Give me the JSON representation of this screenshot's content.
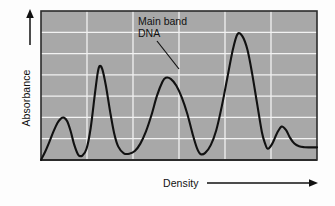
{
  "figure": {
    "background_color": "#fdfdfd",
    "plot_fill_color": "#a8a8a8",
    "grid_color": "#f2f2f2",
    "curve_color": "#111111",
    "frame_color": "#2b2b2b"
  },
  "axes": {
    "y_label": "Absorbance",
    "x_label": "Density",
    "y_arrow": "arrow-up-icon",
    "x_arrow": "arrow-right-icon"
  },
  "annotations": [
    {
      "name": "main-band-dna",
      "line1": "Main band",
      "line2": "DNA",
      "leader": "leader-line"
    }
  ],
  "chart_data": {
    "type": "line",
    "title": "",
    "xlabel": "Density",
    "ylabel": "Absorbance",
    "xlim": [
      0,
      1
    ],
    "ylim": [
      0,
      1
    ],
    "grid": true,
    "grid_x_count": 5,
    "grid_y_count": 6,
    "axis_ticks_labeled": false,
    "legend": "none",
    "annotation_points": [
      {
        "label": "Main band DNA",
        "x": 0.45,
        "y": 0.55
      }
    ],
    "features": [
      {
        "kind": "peak",
        "name": "satellite band 1",
        "x": 0.082,
        "y": 0.285
      },
      {
        "kind": "valley",
        "name": "valley 1",
        "x": 0.135,
        "y": 0.035
      },
      {
        "kind": "peak",
        "name": "satellite band 2",
        "x": 0.212,
        "y": 0.63
      },
      {
        "kind": "valley",
        "name": "valley 2",
        "x": 0.3,
        "y": 0.045
      },
      {
        "kind": "peak",
        "name": "main band DNA",
        "x": 0.452,
        "y": 0.552
      },
      {
        "kind": "valley",
        "name": "valley 3",
        "x": 0.578,
        "y": 0.04
      },
      {
        "kind": "peak",
        "name": "satellite band 3",
        "x": 0.712,
        "y": 0.845
      },
      {
        "kind": "valley",
        "name": "valley 4",
        "x": 0.822,
        "y": 0.075
      },
      {
        "kind": "peak",
        "name": "satellite band 4",
        "x": 0.872,
        "y": 0.225
      },
      {
        "kind": "plateau",
        "name": "baseline tail",
        "x": 0.97,
        "y": 0.085
      }
    ],
    "series": [
      {
        "name": "Absorbance profile",
        "x": [
          0.0,
          0.015,
          0.03,
          0.045,
          0.06,
          0.072,
          0.082,
          0.095,
          0.108,
          0.12,
          0.135,
          0.15,
          0.165,
          0.18,
          0.195,
          0.205,
          0.212,
          0.222,
          0.235,
          0.25,
          0.265,
          0.28,
          0.3,
          0.32,
          0.34,
          0.36,
          0.38,
          0.4,
          0.42,
          0.44,
          0.452,
          0.47,
          0.49,
          0.51,
          0.53,
          0.55,
          0.565,
          0.578,
          0.595,
          0.615,
          0.635,
          0.655,
          0.675,
          0.695,
          0.712,
          0.73,
          0.748,
          0.765,
          0.782,
          0.8,
          0.812,
          0.822,
          0.838,
          0.855,
          0.872,
          0.888,
          0.902,
          0.918,
          0.935,
          0.955,
          0.975,
          1.0
        ],
        "y": [
          0.0,
          0.055,
          0.12,
          0.19,
          0.25,
          0.278,
          0.285,
          0.26,
          0.19,
          0.105,
          0.035,
          0.03,
          0.075,
          0.215,
          0.44,
          0.58,
          0.63,
          0.61,
          0.5,
          0.33,
          0.18,
          0.09,
          0.045,
          0.042,
          0.06,
          0.11,
          0.19,
          0.3,
          0.43,
          0.525,
          0.552,
          0.545,
          0.5,
          0.42,
          0.31,
          0.17,
          0.08,
          0.04,
          0.048,
          0.1,
          0.2,
          0.36,
          0.55,
          0.74,
          0.845,
          0.83,
          0.74,
          0.58,
          0.39,
          0.19,
          0.11,
          0.075,
          0.11,
          0.18,
          0.225,
          0.2,
          0.15,
          0.11,
          0.092,
          0.086,
          0.085,
          0.085
        ]
      }
    ]
  }
}
